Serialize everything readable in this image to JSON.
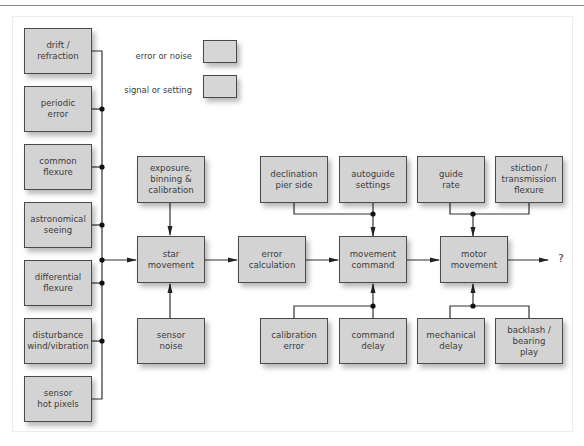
{
  "legend": {
    "items": [
      {
        "label": "error or noise",
        "kind": "error"
      },
      {
        "label": "signal or setting",
        "kind": "signal"
      }
    ],
    "colors": {
      "box_fill": "#d3d3d3",
      "box_border": "#4a4a4a",
      "line": "#333333"
    }
  },
  "inputs": [
    {
      "id": "drift",
      "label": "drift /\nrefraction"
    },
    {
      "id": "periodic",
      "label": "periodic\nerror"
    },
    {
      "id": "common_flexure",
      "label": "common\nflexure"
    },
    {
      "id": "seeing",
      "label": "astronomical\nseeing"
    },
    {
      "id": "diff_flexure",
      "label": "differential\nflexure"
    },
    {
      "id": "disturbance",
      "label": "disturbance\nwind/vibration"
    },
    {
      "id": "hot_pixels",
      "label": "sensor\nhot pixels"
    }
  ],
  "pipeline": [
    {
      "id": "star_movement",
      "label": "star\nmovement"
    },
    {
      "id": "error_calc",
      "label": "error\ncalculation"
    },
    {
      "id": "movement_command",
      "label": "movement\ncommand"
    },
    {
      "id": "motor_movement",
      "label": "motor\nmovement"
    }
  ],
  "top_inputs": [
    {
      "id": "exposure",
      "label": "exposure,\nbinning &\ncalibration",
      "target": "star_movement"
    },
    {
      "id": "declination",
      "label": "declination\npier side",
      "target": "movement_command"
    },
    {
      "id": "autoguide",
      "label": "autoguide\nsettings",
      "target": "movement_command"
    },
    {
      "id": "guide_rate",
      "label": "guide\nrate",
      "target": "motor_movement"
    },
    {
      "id": "stiction",
      "label": "stiction /\ntransmission\nflexure",
      "target": "motor_movement"
    }
  ],
  "bottom_inputs": [
    {
      "id": "sensor_noise",
      "label": "sensor\nnoise",
      "target": "star_movement"
    },
    {
      "id": "calibration_error",
      "label": "calibration\nerror",
      "target": "movement_command"
    },
    {
      "id": "command_delay",
      "label": "command\ndelay",
      "target": "movement_command"
    },
    {
      "id": "mechanical_delay",
      "label": "mechanical\ndelay",
      "target": "motor_movement"
    },
    {
      "id": "backlash",
      "label": "backlash /\nbearing\nplay",
      "target": "motor_movement"
    }
  ],
  "output": {
    "label": "?"
  }
}
